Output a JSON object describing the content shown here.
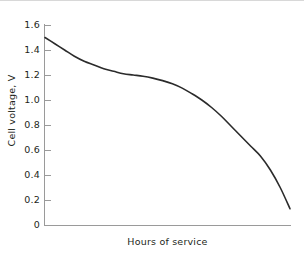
{
  "chart_data": {
    "type": "line",
    "title": "",
    "xlabel": "Hours of service",
    "ylabel": "Cell voltage, V",
    "ylim": [
      0,
      1.6
    ],
    "xlim": [
      0,
      10
    ],
    "grid": false,
    "legend": "none",
    "y_ticks": [
      0,
      0.2,
      0.4,
      0.6,
      0.8,
      1.0,
      1.2,
      1.4,
      1.6
    ],
    "y_tick_labels": [
      "0",
      "0.2",
      "0.4",
      "0.6",
      "0.8",
      "1.0",
      "1.2",
      "1.4",
      "1.6"
    ],
    "x_ticks": [],
    "x_tick_labels": [],
    "series": [
      {
        "name": "Cell discharge curve",
        "x": [
          0.0,
          0.4,
          0.8,
          1.2,
          1.6,
          2.0,
          2.4,
          2.8,
          3.2,
          3.6,
          4.0,
          4.4,
          4.8,
          5.2,
          5.6,
          6.0,
          6.4,
          6.8,
          7.2,
          7.6,
          8.0,
          8.4,
          8.8,
          9.2,
          9.6,
          10.0
        ],
        "y": [
          1.5,
          1.45,
          1.4,
          1.35,
          1.31,
          1.28,
          1.25,
          1.23,
          1.21,
          1.2,
          1.19,
          1.175,
          1.155,
          1.13,
          1.095,
          1.05,
          1.0,
          0.94,
          0.87,
          0.79,
          0.71,
          0.63,
          0.55,
          0.44,
          0.3,
          0.13
        ]
      }
    ],
    "annotations": []
  },
  "axes": {
    "y_axis_name": "cell-voltage-axis",
    "x_axis_name": "hours-of-service-axis"
  },
  "style": {
    "curve_color": "#2b2b2b",
    "axis_color": "#9a9a9a",
    "text_color": "#231f20",
    "background": "#ffffff",
    "rule_color": "#d8d8d8"
  }
}
